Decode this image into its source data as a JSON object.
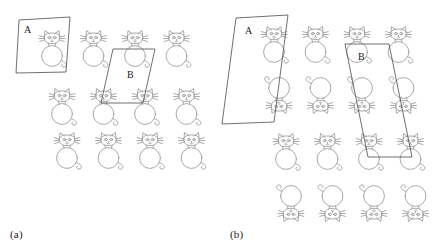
{
  "figure": {
    "title": "",
    "background_color": "#ffffff",
    "stroke_color": "#9a9a9a",
    "region_stroke_color": "#4a4a4a",
    "panels": [
      {
        "id": "a",
        "caption": "(a)",
        "caption_x": 10,
        "caption_y": 228,
        "origin_x": 0,
        "origin_y": 0,
        "rows": [
          {
            "index": 0,
            "y": 30,
            "x_start": 38,
            "spacing": 41.5,
            "count": 4,
            "flipped": false
          },
          {
            "index": 1,
            "y": 88,
            "x_start": 48,
            "spacing": 41.5,
            "count": 4,
            "flipped": false
          },
          {
            "index": 2,
            "y": 132,
            "x_start": 53,
            "spacing": 41.5,
            "count": 4,
            "flipped": false
          }
        ],
        "regions": [
          {
            "name": "A",
            "letter": "A",
            "letter_x": 24,
            "letter_y": 31,
            "points": "19,20 70,17 66,72 16,73",
            "shape": "parallelogram"
          },
          {
            "name": "B",
            "letter": "B",
            "letter_x": 130,
            "letter_y": 76,
            "points": "113,49 155,49 143,103 101,103",
            "shape": "parallelogram"
          }
        ]
      },
      {
        "id": "b",
        "caption": "(b)",
        "caption_x": 230,
        "caption_y": 228,
        "origin_x": 223,
        "origin_y": 0,
        "rows": [
          {
            "index": 0,
            "y": 30,
            "x_start": 260,
            "spacing": 41.5,
            "count": 4,
            "flipped": false
          },
          {
            "index": 1,
            "y": 84,
            "x_start": 265,
            "spacing": 41.5,
            "count": 4,
            "flipped": true
          },
          {
            "index": 2,
            "y": 140,
            "x_start": 272,
            "spacing": 41.5,
            "count": 4,
            "flipped": false
          },
          {
            "index": 3,
            "y": 192,
            "x_start": 277,
            "spacing": 41.5,
            "count": 4,
            "flipped": true
          }
        ],
        "regions": [
          {
            "name": "A",
            "letter": "A",
            "letter_x": 246,
            "letter_y": 32,
            "points": "236,18 288,15 274,122 222,124",
            "shape": "parallelogram"
          },
          {
            "name": "B",
            "letter": "B",
            "letter_x": 360,
            "letter_y": 57,
            "points": "345,44 389,44 412,157 368,157",
            "shape": "parallelogram"
          }
        ]
      }
    ],
    "cat_glyph": {
      "name": "cat-outline",
      "description": "line-drawn cat: round head with two triangular ears, two eyes, whiskers, large circular body, curled tail",
      "width": 30,
      "height": 40
    }
  }
}
